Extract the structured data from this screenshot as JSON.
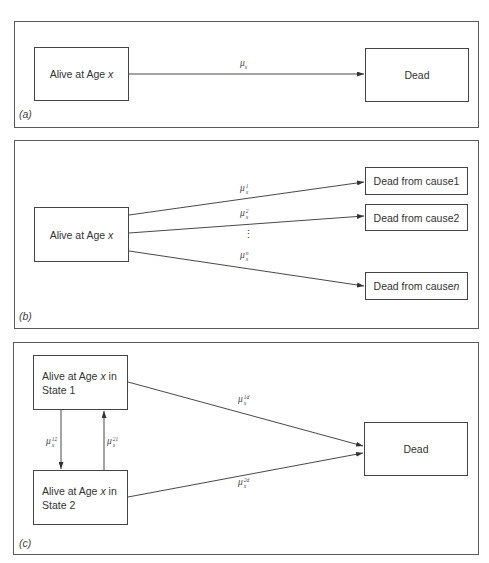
{
  "panels": {
    "a": {
      "label": "(a)",
      "alive_box": {
        "text": "Alive at Age ",
        "var": "x"
      },
      "dead_box": {
        "text": "Dead"
      },
      "transition": {
        "symbol": "μ",
        "sub": "x"
      }
    },
    "b": {
      "label": "(b)",
      "alive_box": {
        "text": "Alive at Age ",
        "var": "x"
      },
      "dead_boxes": [
        {
          "text": "Dead from cause ",
          "suffix": "1"
        },
        {
          "text": "Dead from cause ",
          "suffix": "2"
        },
        {
          "text": "Dead from cause ",
          "suffix_italic": "n"
        }
      ],
      "transitions": [
        {
          "symbol": "μ",
          "sub": "x",
          "sup": "1"
        },
        {
          "symbol": "μ",
          "sub": "x",
          "sup": "2"
        },
        {
          "symbol": "μ",
          "sub": "x",
          "sup": "n"
        }
      ],
      "ellipsis": "⋮"
    },
    "c": {
      "label": "(c)",
      "state1_box": {
        "line1": "Alive at Age ",
        "var": "x",
        "line1_end": " in",
        "line2": "State 1"
      },
      "state2_box": {
        "line1": "Alive at Age ",
        "var": "x",
        "line1_end": " in",
        "line2": "State 2"
      },
      "dead_box": {
        "text": "Dead"
      },
      "transitions": {
        "s12": {
          "symbol": "μ",
          "sub": "x",
          "sup": "12"
        },
        "s21": {
          "symbol": "μ",
          "sub": "x",
          "sup": "21"
        },
        "s1d": {
          "symbol": "μ",
          "sub": "x",
          "sup": "1d"
        },
        "s2d": {
          "symbol": "μ",
          "sub": "x",
          "sup": "2d"
        }
      }
    }
  }
}
